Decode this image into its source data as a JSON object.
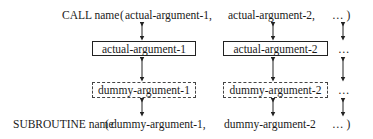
{
  "call_statement": {
    "keyword": "CALL name",
    "open_paren": "(",
    "arg1": "actual-argument-1,",
    "arg2": "actual-argument-2,",
    "ellipsis": "… )"
  },
  "actual_boxes": [
    {
      "label": "actual-argument-1"
    },
    {
      "label": "actual-argument-2"
    }
  ],
  "dummy_boxes": [
    {
      "label": "dummy-argument-1"
    },
    {
      "label": "dummy-argument-2"
    }
  ],
  "row_ellipsis": [
    "…",
    "…"
  ],
  "subroutine_statement": {
    "keyword": "SUBROUTINE name",
    "open_paren": "(",
    "arg1": "dummy-argument-1,",
    "arg2": "dummy-argument-2",
    "ellipsis": "… )"
  }
}
